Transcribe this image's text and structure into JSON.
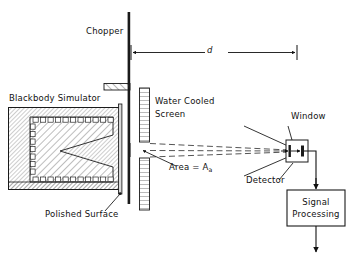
{
  "figure": {
    "type": "schematic-diagram",
    "background_color": "#ffffff",
    "line_color": "#111111"
  },
  "labels": {
    "chopper": "Chopper",
    "distance": "d",
    "blackbody_simulator": "Blackbody Simulator",
    "water_cooled_screen_line1": "Water Cooled",
    "water_cooled_screen_line2": "Screen",
    "area_prefix": "Area = A",
    "area_subscript": "a",
    "window": "Window",
    "detector": "Detector",
    "polished_surface": "Polished Surface",
    "signal_processing_line1": "Signal",
    "signal_processing_line2": "Processing"
  },
  "components": {
    "chopper_shaft": {
      "x": 128,
      "y_top": 12,
      "y_bottom": 204,
      "width": 2.4
    },
    "chopper_blade": {
      "x": 104,
      "y": 84,
      "width": 26,
      "height": 6
    },
    "blackbody_body": {
      "x": 8,
      "y": 107,
      "width": 116,
      "height": 83
    },
    "cavity_apex_x": 60,
    "polished_surface_bar": {
      "x": 119,
      "y": 104,
      "width": 3,
      "height": 90
    },
    "water_cooled_screen": {
      "x": 140,
      "y": 88,
      "width": 10,
      "height": 98
    },
    "aperture_gap": {
      "x": 140,
      "y": 142,
      "height": 16
    },
    "detector_box": {
      "x": 286,
      "y": 140,
      "width": 22,
      "height": 22
    },
    "signal_processing_box": {
      "x": 287,
      "y": 190,
      "width": 58,
      "height": 36
    }
  },
  "dimension": {
    "from_x": 130,
    "to_x": 297,
    "y": 52,
    "label": "d"
  },
  "beam": {
    "style": "dashed",
    "from_x": 141,
    "to_x": 292,
    "top_y_start": 143,
    "bottom_y_start": 157,
    "converge_y": 151
  }
}
